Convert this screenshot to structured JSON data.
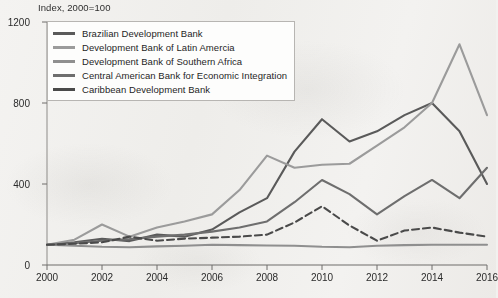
{
  "chart_data": {
    "type": "line",
    "title": "",
    "subtitle": "Index, 2000=100",
    "xlabel": "",
    "ylabel": "",
    "xlim": [
      2000,
      2016
    ],
    "ylim": [
      0,
      1200
    ],
    "yticks": [
      0,
      400,
      800,
      1200
    ],
    "xticks": [
      2000,
      2002,
      2004,
      2006,
      2008,
      2010,
      2012,
      2014,
      2016
    ],
    "grid": false,
    "legend_position": "upper-left",
    "x": [
      2000,
      2001,
      2002,
      2003,
      2004,
      2005,
      2006,
      2007,
      2008,
      2009,
      2010,
      2011,
      2012,
      2013,
      2014,
      2015,
      2016
    ],
    "series": [
      {
        "name": "Brazilian Development Bank",
        "color": "#5a5a5a",
        "style": "solid",
        "values": [
          100,
          112,
          130,
          118,
          150,
          140,
          175,
          260,
          330,
          560,
          720,
          610,
          660,
          740,
          800,
          660,
          400
        ]
      },
      {
        "name": "Development Bank of Latin Amercia",
        "color": "#9b9b9b",
        "style": "solid",
        "values": [
          100,
          125,
          200,
          140,
          185,
          215,
          250,
          370,
          540,
          480,
          495,
          500,
          590,
          680,
          800,
          1090,
          740
        ]
      },
      {
        "name": "Development Bank of Southern Africa",
        "color": "#8f8f8f",
        "style": "solid",
        "values": [
          100,
          95,
          90,
          88,
          92,
          95,
          100,
          98,
          96,
          95,
          90,
          88,
          95,
          98,
          100,
          100,
          100
        ]
      },
      {
        "name": "Central American Bank for Economic Integration",
        "color": "#6e6e6e",
        "style": "solid",
        "values": [
          100,
          108,
          120,
          128,
          140,
          150,
          165,
          185,
          215,
          310,
          420,
          350,
          250,
          340,
          420,
          330,
          480
        ]
      },
      {
        "name": "Caribbean Development Bank",
        "color": "#4a4a4a",
        "style": "dashed",
        "values": [
          100,
          105,
          112,
          140,
          120,
          130,
          135,
          140,
          150,
          210,
          290,
          195,
          120,
          170,
          185,
          160,
          140
        ]
      }
    ]
  },
  "axes": {
    "ytick_labels": [
      "1200",
      "800",
      "400",
      "0"
    ],
    "xtick_labels": [
      "2000",
      "2002",
      "2004",
      "2006",
      "2008",
      "2010",
      "2012",
      "2014",
      "2016"
    ],
    "subtitle": "Index, 2000=100"
  },
  "legend": {
    "entries": [
      {
        "label": "Brazilian Development Bank"
      },
      {
        "label": "Development Bank of Latin Amercia"
      },
      {
        "label": "Development Bank of Southern Africa"
      },
      {
        "label": "Central American Bank for Economic Integration"
      },
      {
        "label": "Caribbean Development Bank"
      }
    ]
  }
}
